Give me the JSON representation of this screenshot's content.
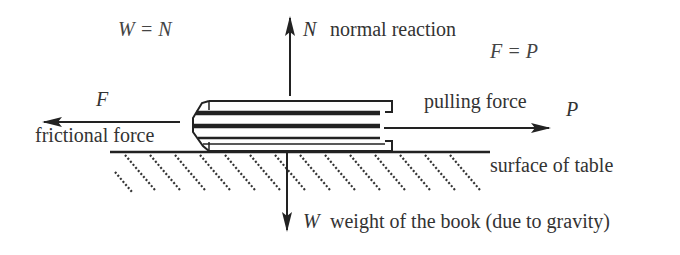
{
  "diagram": {
    "equations": {
      "w_equals_n": "W = N",
      "f_equals_p": "F = P"
    },
    "forces": {
      "normal": {
        "symbol": "N",
        "label": "normal reaction",
        "direction": "up"
      },
      "weight": {
        "symbol": "W",
        "label": "weight of the book (due to gravity)",
        "direction": "down"
      },
      "friction": {
        "symbol": "F",
        "label": "frictional force",
        "direction": "left"
      },
      "pull": {
        "symbol": "P",
        "label": "pulling force",
        "direction": "right"
      }
    },
    "surface": {
      "label": "surface of table"
    },
    "object": {
      "name": "book"
    },
    "colors": {
      "ink": "#333333",
      "background": "#ffffff"
    }
  }
}
